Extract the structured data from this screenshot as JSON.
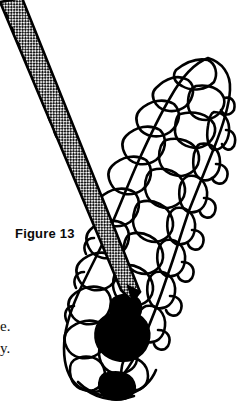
{
  "figure": {
    "caption": "Figure 13",
    "ink_color": "#000000",
    "background_color": "#ffffff",
    "halftone_color": "#1a1a1a",
    "seed_fill_color": "#000000"
  },
  "body_text": {
    "fragment_line_1": "e.",
    "fragment_line_2": "y."
  },
  "icons": {
    "pine_cone": "pine-cone-icon",
    "probe": "probe-tool-icon"
  }
}
